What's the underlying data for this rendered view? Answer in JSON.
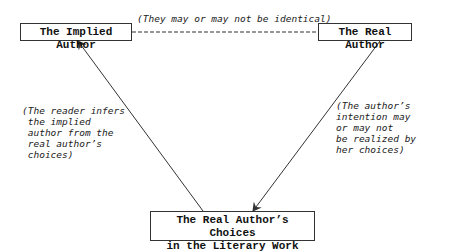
{
  "nodes": {
    "implied_author": "The Implied Author",
    "real_author": "The Real Author",
    "choices_line1": "The Real Author’s Choices",
    "choices_line2": "in the Literary Work"
  },
  "edges": {
    "top_label": "(They may or may not be identical)",
    "left_label": "(The reader infers\n the implied\n author from the\n real author’s\n choices)",
    "right_label": "(The author’s\nintention may\nor may not\nbe realized by\nher choices)"
  },
  "colors": {
    "line": "#333333",
    "text": "#111111",
    "background": "#ffffff"
  }
}
